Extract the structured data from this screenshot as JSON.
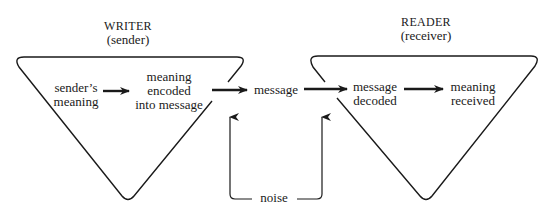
{
  "diagram": {
    "writer": {
      "title": "WRITER",
      "subtitle": "(sender)"
    },
    "reader": {
      "title": "READER",
      "subtitle": "(receiver)"
    },
    "nodes": {
      "senders_meaning": [
        "sender’s",
        "meaning"
      ],
      "meaning_encoded": [
        "meaning",
        "encoded",
        "into message"
      ],
      "message": "message",
      "message_decoded": [
        "message",
        "decoded"
      ],
      "meaning_received": [
        "meaning",
        "received"
      ],
      "noise": "noise"
    },
    "flow": [
      "sender’s meaning",
      "meaning encoded into message",
      "message",
      "message decoded",
      "meaning received"
    ],
    "colors": {
      "ink": "#1a1a1a",
      "background": "#ffffff"
    }
  }
}
